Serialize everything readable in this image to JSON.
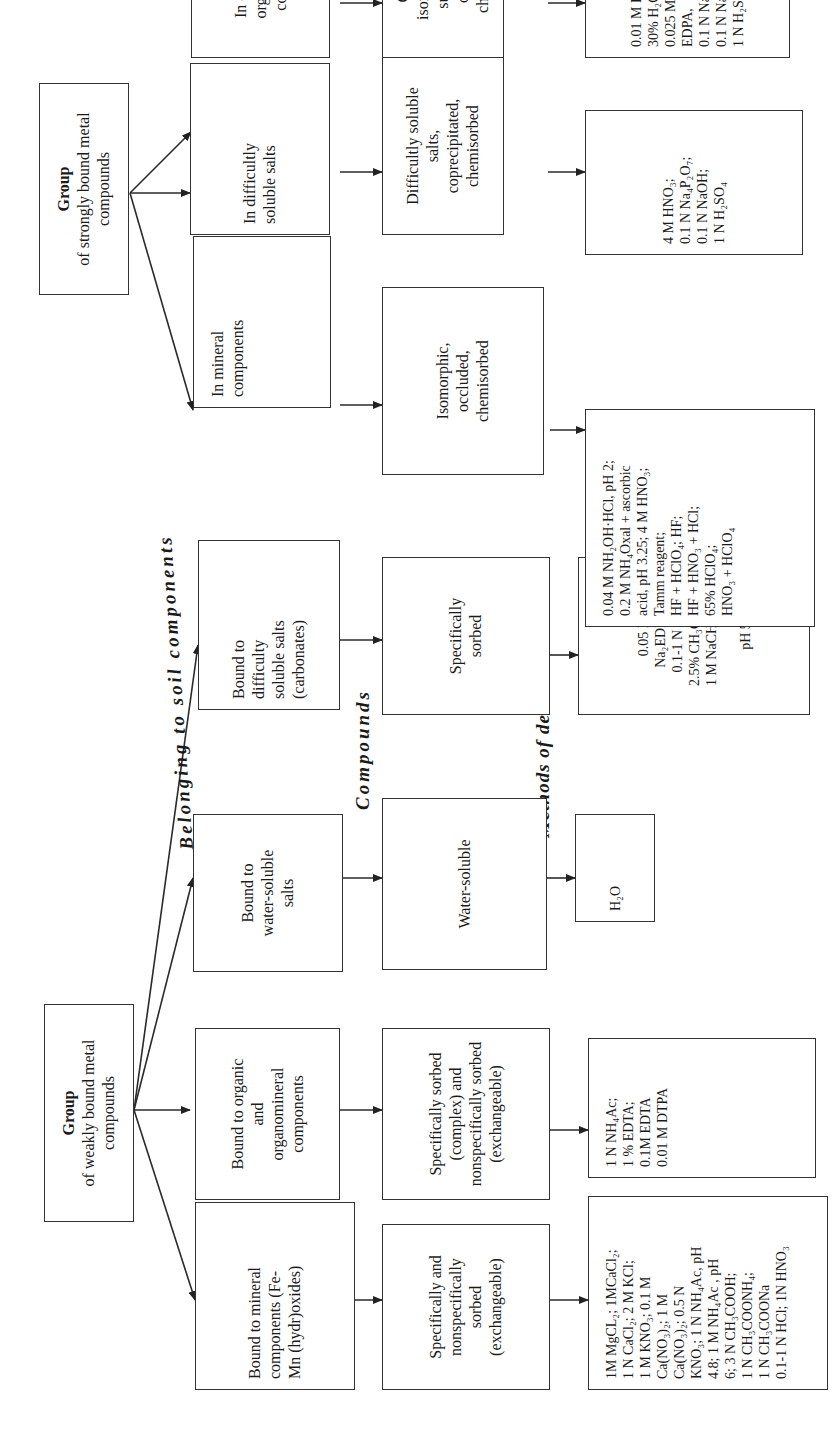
{
  "diagram": {
    "section_labels": {
      "belonging": "Belonging to soil components",
      "compounds": "Compounds",
      "methods": "Methods of determination"
    },
    "groups": [
      {
        "id": "weak",
        "title": "Group",
        "subtitle_lines": [
          "of weakly bound metal",
          "compounds"
        ]
      },
      {
        "id": "strong",
        "title": "Group",
        "subtitle_lines": [
          "of strongly bound metal",
          "compounds"
        ]
      }
    ],
    "columns": [
      {
        "group": "weak",
        "component_lines": [
          "Bound to mineral",
          "components (Fe-",
          "Mn (hydr)oxides)"
        ],
        "compound_lines": [
          "Specifically and",
          "nonspecifically",
          "sorbed",
          "(exchangeable)"
        ],
        "method_lines": [
          "1M MgCL₂; 1MCaCl₂;",
          "1 N CaCl₂; 2 M KCl;",
          "1 M KNO₃; 0.1 M",
          "Ca(NO₃)₂; 1 M",
          "Ca(NO₃)₂; 0.5 N",
          "KNO₃; 1 N NH₄Ac, pH",
          "4.8; 1 M NH₄Ac , pH",
          "6; 3 N CH₃COOH;",
          "1 N CH₃COONH₄;",
          "1 N CH₃COONa",
          "0.1-1 N HCl; 1N HNO₃"
        ]
      },
      {
        "group": "weak",
        "component_lines": [
          "Bound to organic",
          "and",
          "organomineral",
          "components"
        ],
        "compound_lines": [
          "Specifically sorbed",
          "(complex) and",
          "nonspecifically sorbed",
          "(exchangeable)"
        ],
        "method_lines": [
          "1 N NH₄Ac;",
          "1 % EDTA;",
          "0.1M EDTA",
          "0.01 M DTPA"
        ]
      },
      {
        "group": "weak",
        "component_lines": [
          "Bound to",
          "water-soluble",
          "salts"
        ],
        "compound_lines": [
          "Water-soluble"
        ],
        "method_lines": [
          "H₂O"
        ]
      },
      {
        "group": "weak",
        "component_lines": [
          "Bound to",
          "difficulty",
          "soluble salts",
          "(carbonates)"
        ],
        "compound_lines": [
          "Specifically",
          "sorbed"
        ],
        "method_lines": [
          "0.05 M",
          "Na₂EDNA,",
          "0.1-1 N HCl,",
          "2.5% CH₃COOH,",
          "1 M  NaCH₃COO,",
          "",
          "pH 5"
        ]
      },
      {
        "group": "strong",
        "component_lines": [
          "In mineral",
          "components"
        ],
        "compound_lines": [
          "Isomorphic,",
          "occluded,",
          "chemisorbed"
        ],
        "method_lines": [
          "0.04 M NH₂OH·HCl, pH 2;",
          "0.2 M NH₄Oxal + ascorbic",
          "acid, pH 3.25; 4 M HNO₃;",
          "Tamm reagent;",
          "HF + HClO₄; HF;",
          "HF + HNO₃ + HCl;",
          "65% HClO₄;",
          "HNO₃ + HClO₄"
        ]
      },
      {
        "group": "strong",
        "component_lines": [
          "In difficultly",
          "soluble salts"
        ],
        "compound_lines": [
          "Difficultly soluble",
          "salts,",
          "coprecipitated,",
          "chemisorbed"
        ],
        "method_lines": [
          "4 M HNO₃;",
          "0.1 N Na₄P₂O₇;",
          "0.1 N NaOH;",
          "1 N H₂SO₄"
        ]
      },
      {
        "group": "strong",
        "component_lines": [
          "In organic and",
          "organomineral",
          "components"
        ],
        "compound_lines": [
          "Chelated,",
          "isomorphically",
          "substituted,",
          "occluded,",
          "chemisorbed"
        ],
        "method_lines": [
          "0.01 M DTPA,",
          "30% H₂O₂,",
          "0.025 M NH4-",
          "EDPA,",
          "0.1 N Na₄P₂O₇,",
          "0.1 N NaOH,",
          "1 N H₂SO₄"
        ]
      }
    ],
    "colors": {
      "line": "#333333",
      "text": "#1a1a1a",
      "background": "#ffffff"
    }
  }
}
